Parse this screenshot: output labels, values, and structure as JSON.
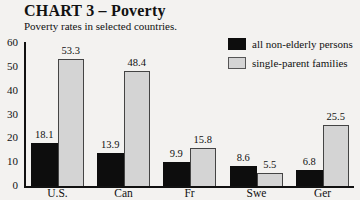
{
  "header": {
    "title": "CHART 3 – Poverty",
    "subtitle": "Poverty rates in selected countries."
  },
  "legend": [
    {
      "label": "all non-elderly persons",
      "color": "#0d0d0d"
    },
    {
      "label": "single-parent families",
      "color": "#d4d4d4"
    }
  ],
  "y_ticks": [
    "0",
    "10",
    "20",
    "30",
    "40",
    "50",
    "60"
  ],
  "chart_data": {
    "type": "bar",
    "title": "CHART 3 – Poverty",
    "subtitle": "Poverty rates in selected countries.",
    "xlabel": "",
    "ylabel": "",
    "ylim": [
      0,
      60
    ],
    "y_ticks": [
      0,
      10,
      20,
      30,
      40,
      50,
      60
    ],
    "grid": false,
    "legend_position": "top-right",
    "categories": [
      "U.S.",
      "Can",
      "Fr",
      "Swe",
      "Ger"
    ],
    "series": [
      {
        "name": "all non-elderly persons",
        "color": "#0d0d0d",
        "values": [
          18.1,
          13.9,
          9.9,
          8.6,
          6.8
        ]
      },
      {
        "name": "single-parent families",
        "color": "#d4d4d4",
        "values": [
          53.3,
          48.4,
          15.8,
          5.5,
          25.5
        ]
      }
    ],
    "value_labels": [
      [
        "18.1",
        "13.9",
        "9.9",
        "8.6",
        "6.8"
      ],
      [
        "53.3",
        "48.4",
        "15.8",
        "5.5",
        "25.5"
      ]
    ]
  }
}
